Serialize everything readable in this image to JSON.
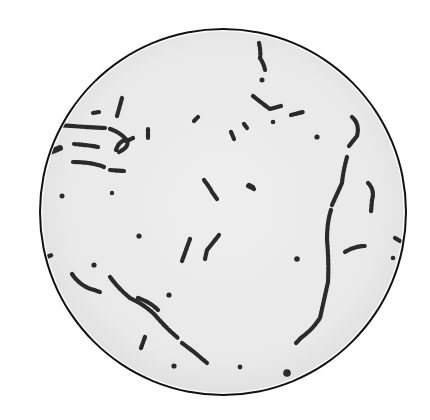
{
  "image": {
    "subject": "Microscope field of view showing chains of cocci bacteria (streptococci)",
    "field_color": "#ececec",
    "rim_color": "#111111",
    "organism_color": "#2a2a2a"
  }
}
